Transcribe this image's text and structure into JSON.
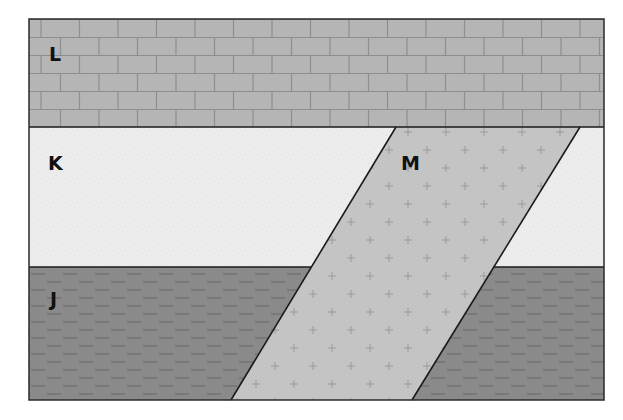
{
  "diagram": {
    "type": "geologic cross-section",
    "frame": {
      "x": 29,
      "y": 19,
      "width": 575,
      "height": 381
    },
    "layers": [
      {
        "id": "L",
        "label": "L",
        "rock_pattern": "brick (limestone)",
        "position": "top",
        "y_top": 19,
        "y_bottom": 127,
        "fill": "#b5b5b5",
        "pattern_color": "#8e8e8e",
        "label_pos": {
          "x": 49,
          "y": 61
        }
      },
      {
        "id": "K",
        "label": "K",
        "rock_pattern": "light speckled (sandstone)",
        "position": "middle",
        "y_top": 127,
        "y_bottom": 267,
        "fill": "#ececec",
        "label_pos": {
          "x": 48,
          "y": 170
        }
      },
      {
        "id": "J",
        "label": "J",
        "rock_pattern": "dashes (shale)",
        "position": "bottom",
        "y_top": 267,
        "y_bottom": 400,
        "fill": "#8a8a8a",
        "pattern_color": "#6e6e6e",
        "label_pos": {
          "x": 50,
          "y": 306
        }
      }
    ],
    "intrusion": {
      "id": "M",
      "label": "M",
      "rock_pattern": "crosses (igneous dike)",
      "fill": "#c4c4c4",
      "pattern_color": "#9a9a9a",
      "polygon": [
        [
          396,
          127
        ],
        [
          580,
          127
        ],
        [
          412,
          400
        ],
        [
          231,
          400
        ]
      ],
      "label_pos": {
        "x": 401,
        "y": 170
      },
      "cuts_layers": [
        "K",
        "J"
      ],
      "cut_by_layer": "L"
    },
    "line_color": "#1a1a1a"
  }
}
